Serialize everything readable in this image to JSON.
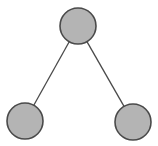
{
  "diagram": {
    "type": "tree",
    "colors": {
      "background": "#ffffff",
      "node_fill": "#b4b4b4",
      "node_stroke": "#4a4a4a",
      "edge_stroke": "#4a4a4a"
    },
    "nodes": [
      {
        "id": "root",
        "cx": 78,
        "cy": 26,
        "r": 18
      },
      {
        "id": "left-child",
        "cx": 25,
        "cy": 121,
        "r": 18
      },
      {
        "id": "right-child",
        "cx": 133,
        "cy": 122,
        "r": 18
      }
    ],
    "edges": [
      {
        "from": "root",
        "to": "left-child"
      },
      {
        "from": "root",
        "to": "right-child"
      }
    ]
  }
}
